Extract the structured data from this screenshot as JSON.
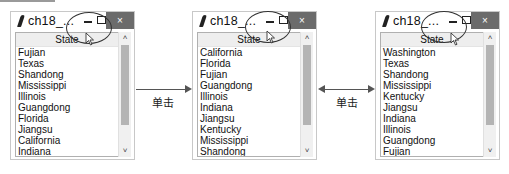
{
  "windows": [
    {
      "title": "ch18_...",
      "close_glyph": "×",
      "column_header": "State",
      "rows": [
        "Fujian",
        "Texas",
        "Shandong",
        "Mississippi",
        "Illinois",
        "Guangdong",
        "Florida",
        "Jiangsu",
        "California",
        "Indiana"
      ],
      "scroll_up": "˄",
      "scroll_down": "˅"
    },
    {
      "title": "ch18_...",
      "close_glyph": "×",
      "column_header": "State",
      "rows": [
        "California",
        "Florida",
        "Fujian",
        "Guangdong",
        "Illinois",
        "Indiana",
        "Jiangsu",
        "Kentucky",
        "Mississippi",
        "Shandong"
      ],
      "scroll_up": "˄",
      "scroll_down": "˅"
    },
    {
      "title": "ch18_...",
      "close_glyph": "×",
      "column_header": "State",
      "rows": [
        "Washington",
        "Texas",
        "Shandong",
        "Mississippi",
        "Kentucky",
        "Jiangsu",
        "Indiana",
        "Illinois",
        "Guangdong",
        "Fujian"
      ],
      "scroll_up": "˄",
      "scroll_down": "˅"
    }
  ],
  "transitions": [
    {
      "label": "单击",
      "direction": "right"
    },
    {
      "label": "单击",
      "direction": "both"
    }
  ]
}
